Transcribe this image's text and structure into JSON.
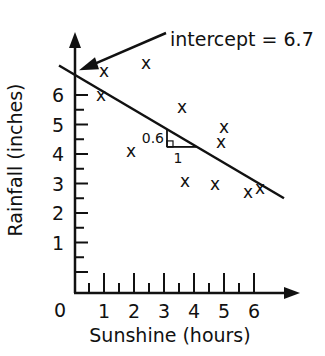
{
  "chart_data": {
    "type": "scatter",
    "title": "",
    "xlabel": "Sunshine (hours)",
    "ylabel": "Rainfall (inches)",
    "xlim": [
      0,
      7
    ],
    "ylim": [
      0,
      7.5
    ],
    "origin_label": "0",
    "x_ticks": [
      1,
      2,
      3,
      4,
      5,
      6
    ],
    "x_tick_labels": [
      "1",
      "2",
      "3",
      "4",
      "5",
      "6"
    ],
    "x_minor_step": 0.5,
    "y_ticks": [
      1,
      2,
      3,
      4,
      5,
      6
    ],
    "y_tick_labels": [
      "1",
      "2",
      "3",
      "4",
      "5",
      "6"
    ],
    "y_minor_step": 0.5,
    "grid": false,
    "legend": null,
    "marker": "x",
    "points": [
      {
        "x": 1.0,
        "y": 6.8
      },
      {
        "x": 2.4,
        "y": 7.1
      },
      {
        "x": 0.9,
        "y": 6.0
      },
      {
        "x": 3.6,
        "y": 5.6
      },
      {
        "x": 1.9,
        "y": 4.1
      },
      {
        "x": 3.7,
        "y": 3.1
      },
      {
        "x": 5.0,
        "y": 4.9
      },
      {
        "x": 4.9,
        "y": 4.4
      },
      {
        "x": 4.7,
        "y": 3.0
      },
      {
        "x": 5.8,
        "y": 2.7
      },
      {
        "x": 6.2,
        "y": 2.85
      }
    ],
    "regression_line": {
      "intercept": 6.7,
      "slope": -0.6,
      "x_range": [
        -0.5,
        7.0
      ]
    },
    "annotations": {
      "intercept_label": "intercept = 6.7",
      "intercept_point": {
        "x": 0,
        "y": 6.7
      },
      "slope_triangle": {
        "x_start": 3.1,
        "run": 1,
        "rise": 0.6,
        "rise_label": "0.6",
        "run_label": "1"
      }
    }
  }
}
